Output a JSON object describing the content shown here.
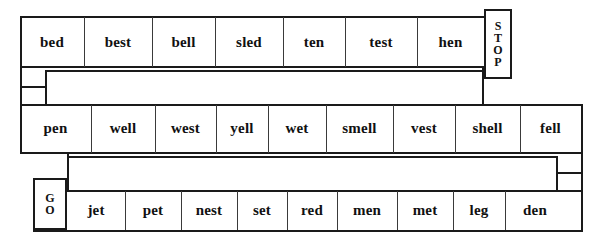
{
  "worksheet": {
    "title": "Word Path Worksheet",
    "path_type": "boustrophedon-snake",
    "ink_color": "#1a1a1a",
    "paper_color": "#ffffff",
    "start_marker": {
      "name": "GO",
      "letters": [
        "G",
        "O"
      ]
    },
    "end_marker": {
      "name": "STOP",
      "letters": [
        "S",
        "T",
        "O",
        "P"
      ]
    }
  },
  "rows": [
    {
      "index": 1,
      "direction": "left-to-right",
      "ends_with_marker": "STOP",
      "words": [
        "bed",
        "best",
        "bell",
        "sled",
        "ten",
        "test",
        "hen"
      ]
    },
    {
      "index": 2,
      "direction": "left-to-right",
      "words": [
        "pen",
        "well",
        "west",
        "yell",
        "wet",
        "smell",
        "vest",
        "shell",
        "fell"
      ]
    },
    {
      "index": 3,
      "direction": "left-to-right",
      "starts_with_marker": "GO",
      "words": [
        "jet",
        "pet",
        "nest",
        "set",
        "red",
        "men",
        "met",
        "leg",
        "den"
      ]
    }
  ],
  "row1": {
    "w0": "bed",
    "w1": "best",
    "w2": "bell",
    "w3": "sled",
    "w4": "ten",
    "w5": "test",
    "w6": "hen"
  },
  "row2": {
    "w0": "pen",
    "w1": "well",
    "w2": "west",
    "w3": "yell",
    "w4": "wet",
    "w5": "smell",
    "w6": "vest",
    "w7": "shell",
    "w8": "fell"
  },
  "row3": {
    "w0": "jet",
    "w1": "pet",
    "w2": "nest",
    "w3": "set",
    "w4": "red",
    "w5": "men",
    "w6": "met",
    "w7": "leg",
    "w8": "den"
  },
  "stop": {
    "l0": "S",
    "l1": "T",
    "l2": "O",
    "l3": "P"
  },
  "go": {
    "l0": "G",
    "l1": "O"
  }
}
